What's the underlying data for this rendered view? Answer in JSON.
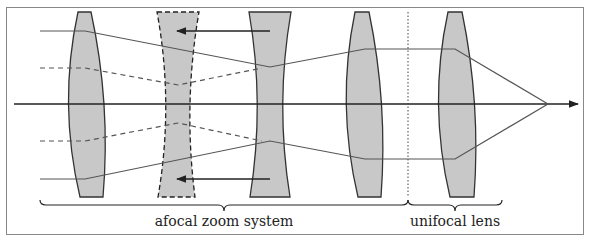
{
  "diagram": {
    "title": "",
    "labels": {
      "afocal": "afocal zoom system",
      "unifocal": "unifocal lens"
    },
    "colors": {
      "lens_fill": "#c8c8c8",
      "lens_stroke": "#333333",
      "ray": "#555555",
      "axis": "#222222",
      "frame": "#888888"
    },
    "elements": [
      {
        "id": "lens-1",
        "type": "convex",
        "style": "solid"
      },
      {
        "id": "lens-2",
        "type": "concave",
        "style": "dashed",
        "moves": "left"
      },
      {
        "id": "lens-3",
        "type": "concave",
        "style": "solid",
        "moves": "left"
      },
      {
        "id": "lens-4",
        "type": "convex",
        "style": "solid"
      },
      {
        "id": "lens-5",
        "type": "convex",
        "style": "solid"
      }
    ],
    "groups": [
      {
        "label": "afocal zoom system",
        "spans": [
          "lens-1",
          "lens-2",
          "lens-3",
          "lens-4"
        ]
      },
      {
        "label": "unifocal lens",
        "spans": [
          "lens-5"
        ]
      }
    ]
  }
}
